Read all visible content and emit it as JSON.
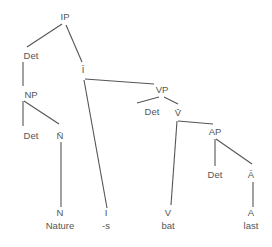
{
  "diagram": {
    "type": "syntax-tree",
    "nodes": [
      {
        "id": "IP",
        "label": "IP",
        "x": 65,
        "y": 20
      },
      {
        "id": "Det1",
        "label": "Det",
        "x": 31,
        "y": 59
      },
      {
        "id": "Ibar",
        "label": "Ī",
        "x": 83,
        "y": 73
      },
      {
        "id": "NP",
        "label": "NP",
        "x": 31,
        "y": 98
      },
      {
        "id": "VP",
        "label": "VP",
        "x": 162,
        "y": 93
      },
      {
        "id": "Det2",
        "label": "Det",
        "x": 31,
        "y": 139
      },
      {
        "id": "Nbar",
        "label": "N̄",
        "x": 60,
        "y": 139
      },
      {
        "id": "Det3",
        "label": "Det",
        "x": 152,
        "y": 115
      },
      {
        "id": "Vbar",
        "label": "V̄",
        "x": 178,
        "y": 116
      },
      {
        "id": "AP",
        "label": "AP",
        "x": 215,
        "y": 135
      },
      {
        "id": "Det4",
        "label": "Det",
        "x": 215,
        "y": 178
      },
      {
        "id": "Abar",
        "label": "Ā",
        "x": 251,
        "y": 178
      },
      {
        "id": "N",
        "label": "N",
        "x": 60,
        "y": 216
      },
      {
        "id": "I",
        "label": "I",
        "x": 106,
        "y": 216
      },
      {
        "id": "V",
        "label": "V",
        "x": 168,
        "y": 216
      },
      {
        "id": "A",
        "label": "A",
        "x": 251,
        "y": 216
      }
    ],
    "leaves": [
      {
        "id": "w-nature",
        "label": "Nature",
        "x": 60,
        "y": 229
      },
      {
        "id": "w-s",
        "label": "-s",
        "x": 106,
        "y": 229
      },
      {
        "id": "w-bat",
        "label": "bat",
        "x": 168,
        "y": 229
      },
      {
        "id": "w-last",
        "label": "last",
        "x": 251,
        "y": 229
      }
    ],
    "edges": [
      {
        "from": "IP",
        "to": "Det1",
        "x1": 62,
        "y1": 24,
        "x2": 27,
        "y2": 47
      },
      {
        "from": "IP",
        "to": "Ibar",
        "x1": 66,
        "y1": 25,
        "x2": 82,
        "y2": 62
      },
      {
        "from": "Det1",
        "to": "NP",
        "x1": 23,
        "y1": 62,
        "x2": 23,
        "y2": 86
      },
      {
        "from": "NP",
        "to": "Det2",
        "x1": 23,
        "y1": 101,
        "x2": 23,
        "y2": 126
      },
      {
        "from": "NP",
        "to": "Nbar",
        "x1": 24,
        "y1": 101,
        "x2": 59,
        "y2": 124
      },
      {
        "from": "Nbar",
        "to": "N",
        "x1": 61,
        "y1": 142,
        "x2": 61,
        "y2": 207
      },
      {
        "from": "Ibar",
        "to": "I",
        "x1": 84,
        "y1": 80,
        "x2": 107,
        "y2": 208
      },
      {
        "from": "Ibar",
        "to": "VP",
        "x1": 85,
        "y1": 79,
        "x2": 154,
        "y2": 84
      },
      {
        "from": "VP",
        "to": "Det3",
        "x1": 159,
        "y1": 97,
        "x2": 137,
        "y2": 103
      },
      {
        "from": "VP",
        "to": "Vbar",
        "x1": 164,
        "y1": 97,
        "x2": 178,
        "y2": 104
      },
      {
        "from": "Vbar",
        "to": "V",
        "x1": 177,
        "y1": 121,
        "x2": 171,
        "y2": 205
      },
      {
        "from": "Vbar",
        "to": "AP",
        "x1": 178,
        "y1": 121,
        "x2": 213,
        "y2": 124
      },
      {
        "from": "AP",
        "to": "Det4",
        "x1": 215,
        "y1": 139,
        "x2": 215,
        "y2": 166
      },
      {
        "from": "AP",
        "to": "Abar",
        "x1": 216,
        "y1": 139,
        "x2": 252,
        "y2": 164
      },
      {
        "from": "Abar",
        "to": "A",
        "x1": 253,
        "y1": 182,
        "x2": 253,
        "y2": 207
      }
    ],
    "colors": {
      "line": "#555555",
      "text": "#555555",
      "background": "#ffffff"
    }
  }
}
